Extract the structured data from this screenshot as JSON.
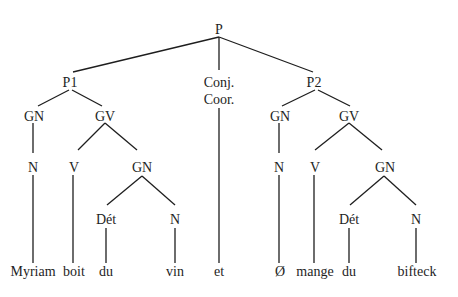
{
  "diagram": {
    "type": "syntax-tree",
    "nodes": {
      "p": "P",
      "p1": "P1",
      "conj_line1": "Conj.",
      "conj_line2": "Coor.",
      "p2": "P2",
      "p1_gn": "GN",
      "p1_gv": "GV",
      "p2_gn": "GN",
      "p2_gv": "GV",
      "p1_gn_n": "N",
      "p1_gv_v": "V",
      "p1_gv_gn": "GN",
      "p2_gn_n": "N",
      "p2_gv_v": "V",
      "p2_gv_gn": "GN",
      "p1_det": "Dét",
      "p1_n": "N",
      "p2_det": "Dét",
      "p2_n": "N"
    },
    "words": [
      "Myriam",
      "boit",
      "du",
      "vin",
      "et",
      "Ø",
      "mange",
      "du",
      "bifteck"
    ],
    "line_color": "#1e1e1e"
  }
}
